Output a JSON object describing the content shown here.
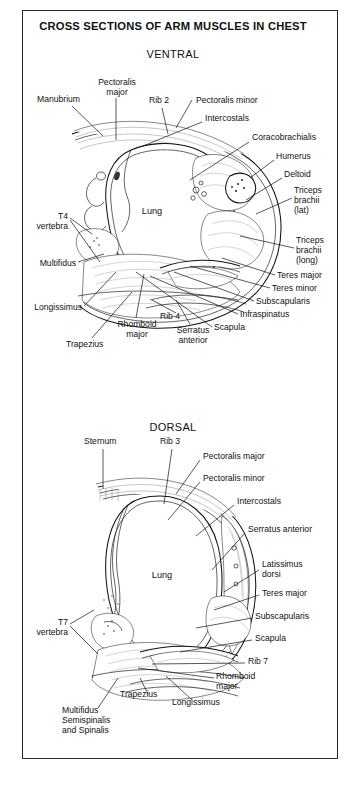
{
  "figure": {
    "title": "CROSS SECTIONS OF ARM MUSCLES IN CHEST",
    "border_color": "#2b2b2b",
    "background": "#ffffff"
  },
  "sections": [
    {
      "id": "ventral",
      "heading": "VENTRAL",
      "organ_label": "Lung",
      "labels": [
        {
          "key": "manubrium",
          "text": "Manubrium"
        },
        {
          "key": "pectoralis_major",
          "text": "Pectoralis\nmajor"
        },
        {
          "key": "rib2",
          "text": "Rib 2"
        },
        {
          "key": "pectoralis_minor",
          "text": "Pectoralis minor"
        },
        {
          "key": "intercostals",
          "text": "Intercostals"
        },
        {
          "key": "coracobrachialis",
          "text": "Coracobrachialis"
        },
        {
          "key": "humerus",
          "text": "Humerus"
        },
        {
          "key": "deltoid",
          "text": "Deltoid"
        },
        {
          "key": "triceps_lat",
          "text": "Triceps\nbrachii\n(lat)"
        },
        {
          "key": "triceps_long",
          "text": "Triceps\nbrachii\n(long)"
        },
        {
          "key": "teres_major",
          "text": "Teres major"
        },
        {
          "key": "teres_minor",
          "text": "Teres minor"
        },
        {
          "key": "subscapularis",
          "text": "Subscapularis"
        },
        {
          "key": "infraspinatus",
          "text": "Infraspinatus"
        },
        {
          "key": "scapula",
          "text": "Scapula"
        },
        {
          "key": "rib4",
          "text": "Rib 4"
        },
        {
          "key": "serratus_anterior",
          "text": "Serratus\nanterior"
        },
        {
          "key": "rhomboid_major",
          "text": "Rhomboid\nmajor"
        },
        {
          "key": "trapezius",
          "text": "Trapezius"
        },
        {
          "key": "longissimus",
          "text": "Longissimus"
        },
        {
          "key": "multifidus",
          "text": "Multifidus"
        },
        {
          "key": "t4_vertebra",
          "text": "T4\nvertebra"
        }
      ]
    },
    {
      "id": "dorsal",
      "heading": "DORSAL",
      "organ_label": "Lung",
      "labels": [
        {
          "key": "sternum",
          "text": "Sternum"
        },
        {
          "key": "rib3",
          "text": "Rib 3"
        },
        {
          "key": "pectoralis_major",
          "text": "Pectoralis major"
        },
        {
          "key": "pectoralis_minor",
          "text": "Pectoralis minor"
        },
        {
          "key": "intercostals",
          "text": "Intercostals"
        },
        {
          "key": "serratus_anterior",
          "text": "Serratus anterior"
        },
        {
          "key": "latissimus_dorsi",
          "text": "Latissimus\ndorsi"
        },
        {
          "key": "teres_major",
          "text": "Teres major"
        },
        {
          "key": "subscapularis",
          "text": "Subscapularis"
        },
        {
          "key": "scapula",
          "text": "Scapula"
        },
        {
          "key": "rib7",
          "text": "Rib 7"
        },
        {
          "key": "rhomboid_major",
          "text": "Rhomboid\nmajor"
        },
        {
          "key": "longissimus",
          "text": "Longissimus"
        },
        {
          "key": "trapezius",
          "text": "Trapezius"
        },
        {
          "key": "multifidus_group",
          "text": "Multifidus\nSemispinalis\nand Spinalis"
        },
        {
          "key": "t7_vertebra",
          "text": "T7\nvertebra"
        }
      ]
    }
  ]
}
